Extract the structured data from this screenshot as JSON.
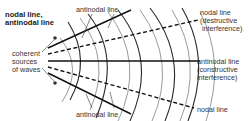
{
  "diagram": {
    "legend_title_line1": "nodal line,",
    "legend_title_line2": "antinodal line",
    "labels": {
      "antinodal_top": "antinodal line",
      "antinodal_bottom": "antinodal line",
      "sources_line1": "coherent",
      "sources_line2": "sources",
      "sources_line3": "of waves",
      "nodal_top_line1": "nodal line",
      "nodal_top_line2": "(destructive",
      "nodal_top_line3": "interference)",
      "antinodal_mid_line1": "antinodal line",
      "antinodal_mid_line2": "(constructive",
      "antinodal_mid_line3": "interference)",
      "nodal_bottom": "nodal line"
    },
    "colors": {
      "dark_wavefront": "#2a2a2a",
      "light_wavefront": "#9a9a9a",
      "interference_line": "#111111",
      "text": "#333333"
    }
  }
}
